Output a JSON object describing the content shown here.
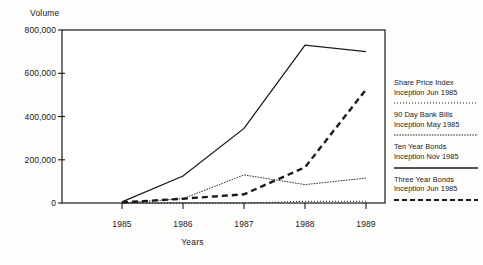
{
  "axis": {
    "y_title": "Volume",
    "x_title": "Years",
    "y_ticks": [
      "800,000",
      "600,000",
      "400,000",
      "200,000",
      "0"
    ],
    "x_ticks": [
      "1985",
      "1986",
      "1987",
      "1988",
      "1989"
    ]
  },
  "legend": {
    "entries": [
      {
        "line1": "Share Price Index",
        "line2": "Inception Jun 1985",
        "sample": "fine-dotted"
      },
      {
        "line1": "90 Day Bank Bills",
        "line2": "Inception May 1985",
        "sample": "thin-dotted"
      },
      {
        "line1": "Ten Year Bonds",
        "line2": "Inception Nov 1985",
        "sample": "solid"
      },
      {
        "line1": "Three Year Bonds",
        "line2": "Inception Jun 1985",
        "sample": "thick-dashed"
      }
    ]
  },
  "chart_data": {
    "type": "line",
    "title": "",
    "xlabel": "Years",
    "ylabel": "Volume",
    "x": [
      "1985",
      "1986",
      "1987",
      "1988",
      "1989"
    ],
    "xlim": [
      1985,
      1989
    ],
    "ylim": [
      0,
      800000
    ],
    "yticks": [
      0,
      200000,
      400000,
      600000,
      800000
    ],
    "grid": false,
    "legend_position": "right",
    "series": [
      {
        "name": "Three Year Bonds",
        "style": "solid",
        "values": [
          5000,
          125000,
          345000,
          730000,
          700000
        ]
      },
      {
        "name": "Ten Year Bonds",
        "style": "thick-dashed",
        "values": [
          3000,
          20000,
          40000,
          165000,
          525000
        ]
      },
      {
        "name": "90 Day Bank Bills",
        "style": "thin-dotted",
        "values": [
          0,
          20000,
          130000,
          85000,
          115000
        ]
      },
      {
        "name": "Share Price Index",
        "style": "fine-dotted",
        "values": [
          0,
          0,
          0,
          8000,
          8000
        ]
      }
    ]
  }
}
